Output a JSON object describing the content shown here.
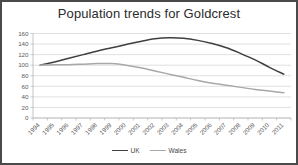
{
  "chart_data": {
    "type": "line",
    "title": "Population trends for Goldcrest",
    "xlabel": "",
    "ylabel": "",
    "categories": [
      "1994",
      "1995",
      "1996",
      "1997",
      "1998",
      "1999",
      "2000",
      "2001",
      "2002",
      "2003",
      "2004",
      "2005",
      "2006",
      "2007",
      "2008",
      "2009",
      "2010",
      "2011"
    ],
    "series": [
      {
        "name": "UK",
        "color": "#3f3f3f",
        "values": [
          100,
          106,
          113,
          120,
          127,
          133,
          139,
          145,
          150,
          152,
          151,
          147,
          141,
          133,
          122,
          110,
          96,
          83
        ]
      },
      {
        "name": "Wales",
        "color": "#a8a8a8",
        "values": [
          100,
          101,
          101,
          102,
          103,
          103,
          100,
          95,
          89,
          83,
          77,
          71,
          66,
          62,
          58,
          54,
          51,
          48
        ]
      }
    ],
    "ylim": [
      0,
      160
    ],
    "yticks": [
      0,
      20,
      40,
      60,
      80,
      100,
      120,
      140,
      160
    ],
    "ytick_labels": [
      "0",
      "20",
      "40",
      "60",
      "80",
      "100",
      "120",
      "140",
      "160"
    ],
    "grid": true,
    "legend_position": "bottom"
  },
  "legend": {
    "entries": [
      {
        "label": "UK"
      },
      {
        "label": "Wales"
      }
    ]
  },
  "colors": {
    "frame": "#4a4a4a",
    "gridline": "#d3d3d3",
    "axis": "#b5b5b5",
    "tick_text": "#5a5a5a",
    "title_text": "#2b2b2b",
    "background": "#ffffff"
  }
}
